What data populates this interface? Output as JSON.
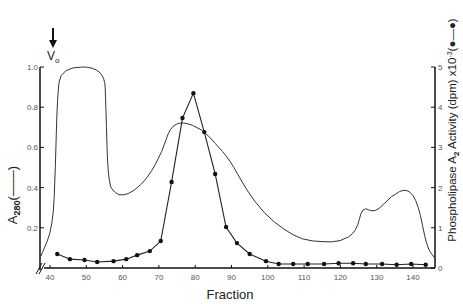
{
  "chart_data": {
    "type": "line",
    "title": "",
    "xlabel": "Fraction",
    "ylabel_left": "A280 (——)",
    "ylabel_right": "Phospholipase A2 Activity (dpm) x10^-3 (●—●)",
    "annotation": {
      "label": "Vo",
      "marker": "down-arrow",
      "x": 41
    },
    "x_axis": {
      "range": [
        40,
        145
      ],
      "ticks": [
        40,
        50,
        60,
        70,
        80,
        90,
        100,
        110,
        120,
        130,
        140
      ],
      "axis_break": true
    },
    "y_left": {
      "range": [
        0,
        1.0
      ],
      "ticks": [
        0.2,
        0.4,
        0.6,
        0.8,
        1.0
      ],
      "tick_labels": [
        "0.2",
        "0.4",
        "0.6",
        "0.8",
        "1.0"
      ]
    },
    "y_right": {
      "range": [
        0,
        5
      ],
      "ticks": [
        0,
        1,
        2,
        3,
        4,
        5
      ],
      "tick_labels": [
        "0",
        "1",
        "2",
        "3",
        "4",
        "5"
      ]
    },
    "grid": false,
    "legend": "inline in axis titles",
    "series": [
      {
        "name": "A280",
        "axis": "left",
        "style": "solid line, no markers",
        "x": [
          40.2,
          40.8,
          41.5,
          42,
          43,
          55,
          55.4,
          56,
          58,
          60,
          63,
          67,
          71,
          73,
          76.5,
          82,
          85.5,
          89.5,
          94,
          99,
          104.5,
          109.5,
          115,
          120,
          124.5,
          126,
          129.5,
          134,
          138.5,
          141.5,
          143.8,
          146
        ],
        "values": [
          0.06,
          0.2,
          0.5,
          0.85,
          1.0,
          1.0,
          0.8,
          0.42,
          0.37,
          0.36,
          0.38,
          0.45,
          0.58,
          0.7,
          0.73,
          0.69,
          0.62,
          0.54,
          0.39,
          0.27,
          0.19,
          0.14,
          0.13,
          0.13,
          0.18,
          0.31,
          0.27,
          0.36,
          0.4,
          0.32,
          0.1,
          0.05
        ]
      },
      {
        "name": "Phospholipase A2 Activity",
        "axis": "right",
        "style": "line with filled circle markers",
        "x": [
          42,
          45.5,
          49.5,
          53,
          57.5,
          61,
          64,
          67.5,
          70.5,
          73.5,
          76.5,
          79.5,
          82.5,
          85.5,
          88.5,
          91.5,
          95,
          99.5,
          103,
          107,
          111,
          115.5,
          119.5,
          123.5,
          127,
          131.5,
          135.5,
          139.5,
          143.5
        ],
        "values": [
          0.35,
          0.22,
          0.2,
          0.15,
          0.17,
          0.22,
          0.32,
          0.42,
          0.67,
          2.14,
          3.73,
          4.35,
          3.38,
          2.34,
          1.02,
          0.62,
          0.35,
          0.17,
          0.1,
          0.1,
          0.1,
          0.1,
          0.12,
          0.12,
          0.1,
          0.1,
          0.08,
          0.1,
          0.08
        ]
      }
    ]
  },
  "labels": {
    "x_title": "Fraction",
    "left_title_main": "A",
    "left_title_sub": "280",
    "left_title_legend": "(——)",
    "right_title_main": "Phospholipase A",
    "right_title_sub": "2",
    "right_title_rest": " Activity (dpm) x10",
    "right_title_sup": "-3",
    "right_title_legend": "(●—●)",
    "vo_main": "V",
    "vo_sub": "o"
  }
}
